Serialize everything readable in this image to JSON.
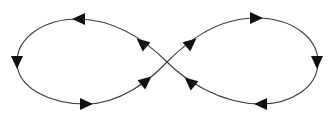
{
  "diagram": {
    "type": "figure-eight loop with direction arrows",
    "colors": {
      "stroke": "#3a3a3a",
      "arrowhead": "#111111",
      "background": "#ffffff"
    },
    "center_crossing": [
      167,
      62
    ],
    "loops": [
      {
        "name": "left-loop",
        "direction": "counterclockwise",
        "arrows": [
          {
            "position": "top",
            "x": 79,
            "y": 19,
            "points": "left"
          },
          {
            "position": "left",
            "x": 17,
            "y": 62,
            "points": "down"
          },
          {
            "position": "bottom",
            "x": 86,
            "y": 104,
            "points": "right"
          },
          {
            "position": "lower-inner",
            "x": 146,
            "y": 81,
            "points": "up-right"
          },
          {
            "position": "upper-inner",
            "x": 142,
            "y": 43,
            "points": "up-left"
          }
        ]
      },
      {
        "name": "right-loop",
        "direction": "clockwise",
        "arrows": [
          {
            "position": "upper-inner",
            "x": 191,
            "y": 43,
            "points": "up-right"
          },
          {
            "position": "top",
            "x": 256,
            "y": 18,
            "points": "right"
          },
          {
            "position": "right",
            "x": 317,
            "y": 62,
            "points": "down"
          },
          {
            "position": "bottom",
            "x": 261,
            "y": 104,
            "points": "left"
          },
          {
            "position": "lower-inner",
            "x": 190,
            "y": 82,
            "points": "up-left"
          }
        ]
      }
    ]
  }
}
